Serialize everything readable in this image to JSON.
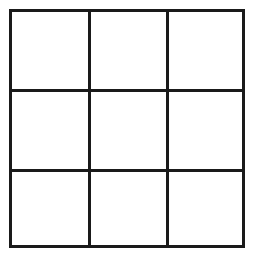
{
  "game": {
    "type": "tic-tac-toe",
    "rows": 3,
    "cols": 3,
    "line_color": "#1a1a1a",
    "background_color": "#ffffff",
    "cells": [
      [
        "",
        "",
        ""
      ],
      [
        "",
        "",
        ""
      ],
      [
        "",
        "",
        ""
      ]
    ]
  }
}
